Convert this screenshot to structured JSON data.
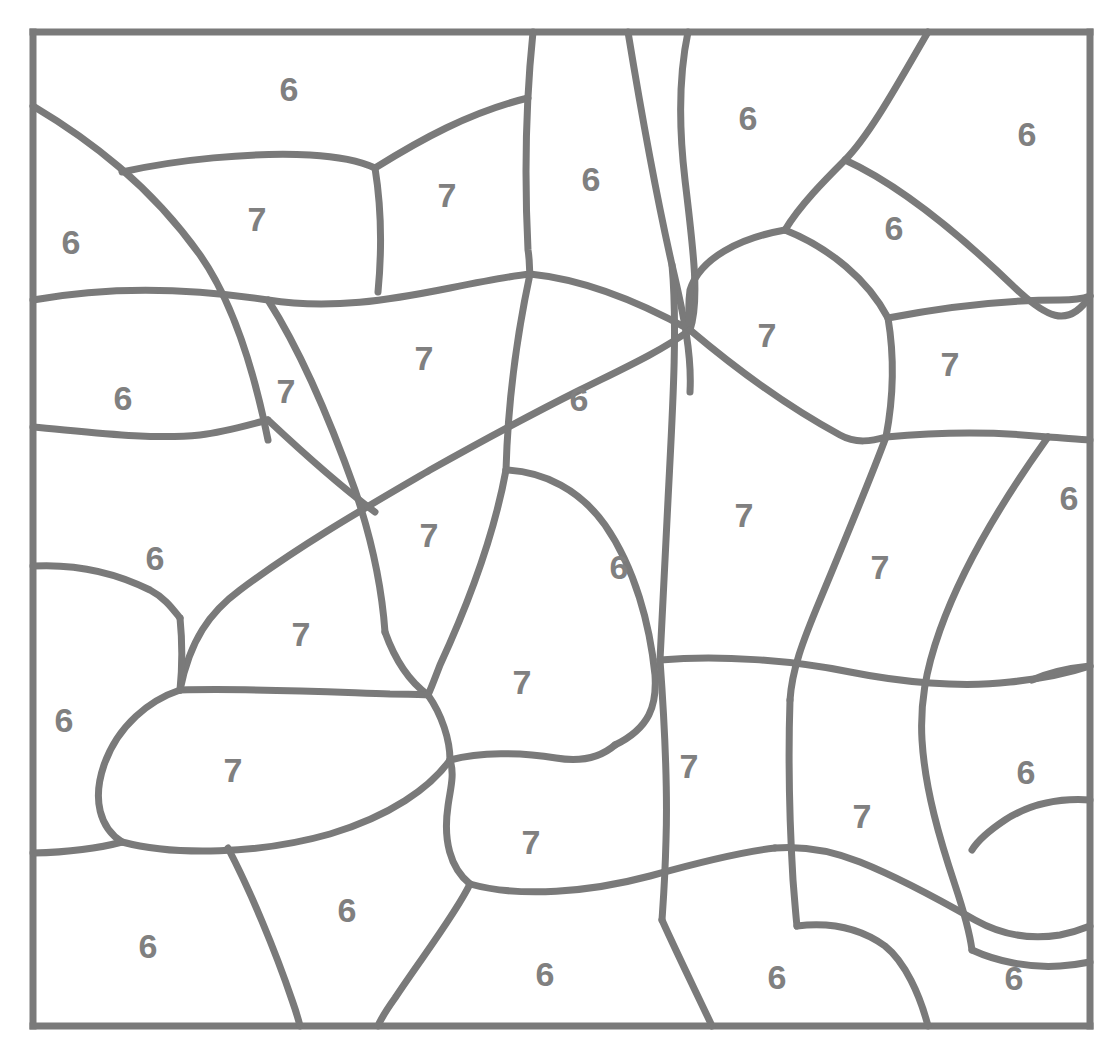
{
  "page": {
    "background_color": "#ffffff",
    "line_color": "#7a7a7a",
    "number_color": "#808080",
    "width": 1103,
    "height": 1046
  },
  "frame": {
    "left": 33,
    "top": 32,
    "right": 1090,
    "bottom": 1026,
    "stroke_width": 7
  },
  "legend": {
    "distinct_values": [
      "6",
      "7"
    ],
    "count_6": 24,
    "count_7": 21,
    "total_regions": 45
  },
  "regions": [
    {
      "id": "r01",
      "label": "6",
      "x": 289,
      "y": 92
    },
    {
      "id": "r02",
      "label": "6",
      "x": 71,
      "y": 245
    },
    {
      "id": "r03",
      "label": "7",
      "x": 257,
      "y": 222
    },
    {
      "id": "r04",
      "label": "7",
      "x": 447,
      "y": 198
    },
    {
      "id": "r05",
      "label": "6",
      "x": 591,
      "y": 182
    },
    {
      "id": "r06",
      "label": "6",
      "x": 748,
      "y": 121
    },
    {
      "id": "r07",
      "label": "6",
      "x": 1027,
      "y": 137
    },
    {
      "id": "r08",
      "label": "6",
      "x": 894,
      "y": 231
    },
    {
      "id": "r09",
      "label": "6",
      "x": 123,
      "y": 401
    },
    {
      "id": "r10",
      "label": "7",
      "x": 286,
      "y": 394
    },
    {
      "id": "r11",
      "label": "7",
      "x": 424,
      "y": 361
    },
    {
      "id": "r12",
      "label": "7",
      "x": 767,
      "y": 338
    },
    {
      "id": "r13",
      "label": "7",
      "x": 950,
      "y": 367
    },
    {
      "id": "r14",
      "label": "6",
      "x": 579,
      "y": 402
    },
    {
      "id": "r15",
      "label": "6",
      "x": 155,
      "y": 561
    },
    {
      "id": "r16",
      "label": "7",
      "x": 429,
      "y": 538
    },
    {
      "id": "r17",
      "label": "7",
      "x": 744,
      "y": 518
    },
    {
      "id": "r18",
      "label": "6",
      "x": 1069,
      "y": 501
    },
    {
      "id": "r19",
      "label": "6",
      "x": 619,
      "y": 570
    },
    {
      "id": "r20",
      "label": "7",
      "x": 880,
      "y": 570
    },
    {
      "id": "r21",
      "label": "7",
      "x": 301,
      "y": 637
    },
    {
      "id": "r22",
      "label": "6",
      "x": 64,
      "y": 723
    },
    {
      "id": "r23",
      "label": "7",
      "x": 522,
      "y": 685
    },
    {
      "id": "r24",
      "label": "7",
      "x": 233,
      "y": 773
    },
    {
      "id": "r25",
      "label": "7",
      "x": 689,
      "y": 769
    },
    {
      "id": "r26",
      "label": "6",
      "x": 1026,
      "y": 775
    },
    {
      "id": "r27",
      "label": "7",
      "x": 862,
      "y": 819
    },
    {
      "id": "r28",
      "label": "7",
      "x": 531,
      "y": 845
    },
    {
      "id": "r29",
      "label": "6",
      "x": 347,
      "y": 913
    },
    {
      "id": "r30",
      "label": "6",
      "x": 148,
      "y": 949
    },
    {
      "id": "r31",
      "label": "6",
      "x": 545,
      "y": 977
    },
    {
      "id": "r32",
      "label": "6",
      "x": 777,
      "y": 980
    },
    {
      "id": "r33",
      "label": "6",
      "x": 1014,
      "y": 981
    }
  ]
}
